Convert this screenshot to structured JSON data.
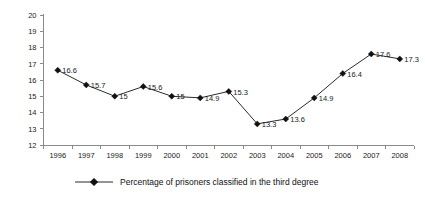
{
  "chart_data": {
    "type": "line",
    "title": "",
    "xlabel": "",
    "ylabel": "",
    "categories": [
      "1996",
      "1997",
      "1998",
      "1999",
      "2000",
      "2001",
      "2002",
      "2003",
      "2004",
      "2005",
      "2006",
      "2007",
      "2008"
    ],
    "values": [
      16.6,
      15.7,
      15,
      15.6,
      15,
      14.9,
      15.3,
      13.3,
      13.6,
      14.9,
      16.4,
      17.6,
      17.3
    ],
    "point_labels": [
      "16.6",
      "15.7",
      "15",
      "15.6",
      "15",
      "14.9",
      "15.3",
      "13.3",
      "13.6",
      "14.9",
      "16.4",
      "17.6",
      "17.3"
    ],
    "series": [
      {
        "name": "Percentage of prisoners classified in the third degree",
        "values": [
          16.6,
          15.7,
          15,
          15.6,
          15,
          14.9,
          15.3,
          13.3,
          13.6,
          14.9,
          16.4,
          17.6,
          17.3
        ],
        "marker": "diamond",
        "color": "#2b2b2b"
      }
    ],
    "ylim": [
      12,
      20
    ],
    "ytick_labels": [
      "20",
      "19",
      "18",
      "17",
      "16",
      "15",
      "14",
      "13",
      "12"
    ],
    "yticks": [
      20,
      19,
      18,
      17,
      16,
      15,
      14,
      13,
      12
    ],
    "grid": false,
    "legend": {
      "position": "bottom",
      "entries": [
        "Percentage of prisoners classified in the third degree"
      ]
    },
    "colors": {
      "line": "#2b2b2b",
      "marker": "#111111",
      "axis": "#8a8a8a",
      "text": "#1a1a1a",
      "background": "#ffffff"
    }
  },
  "legend": {
    "label": "Percentage of prisoners classified in the third degree"
  },
  "yaxis": {
    "labels": [
      "20",
      "19",
      "18",
      "17",
      "16",
      "15",
      "14",
      "13",
      "12"
    ]
  },
  "xaxis": {
    "labels": [
      "1996",
      "1997",
      "1998",
      "1999",
      "2000",
      "2001",
      "2002",
      "2003",
      "2004",
      "2005",
      "2006",
      "2007",
      "2008"
    ]
  }
}
